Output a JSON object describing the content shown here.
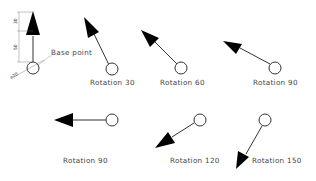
{
  "diagram": {
    "base_point_label": "Base point",
    "dimensions": {
      "head_length": "30",
      "shaft_length": "50",
      "circle_diameter": "⌀20"
    },
    "items": [
      {
        "label": "Rotation  30",
        "angle": 30
      },
      {
        "label": "Rotation  60",
        "angle": 60
      },
      {
        "label": "Rotation  90",
        "angle": 70
      },
      {
        "label": "Rotation  90",
        "angle": 90
      },
      {
        "label": "Rotation  120",
        "angle": 120
      },
      {
        "label": "Rotation  150",
        "angle": 150
      }
    ],
    "colors": {
      "line": "#333333",
      "fill": "#000000",
      "text": "#444444"
    }
  }
}
